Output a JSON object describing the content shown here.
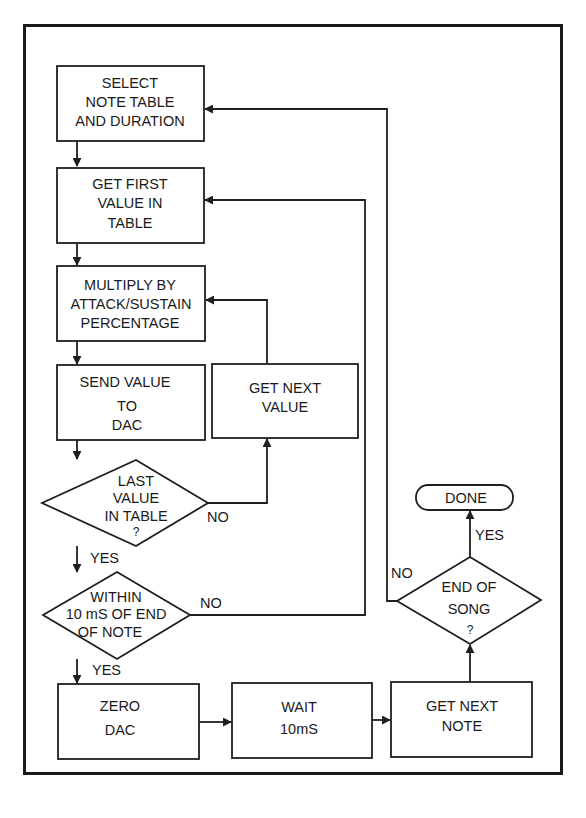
{
  "diagram": {
    "type": "flowchart",
    "nodes": {
      "select_note": {
        "kind": "process",
        "lines": [
          "SELECT",
          "NOTE TABLE",
          "AND DURATION"
        ]
      },
      "get_first": {
        "kind": "process",
        "lines": [
          "GET FIRST",
          "VALUE IN",
          "TABLE"
        ]
      },
      "multiply": {
        "kind": "process",
        "lines": [
          "MULTIPLY BY",
          "ATTACK/SUSTAIN",
          "PERCENTAGE"
        ]
      },
      "send_value": {
        "kind": "process",
        "lines": [
          "SEND VALUE",
          "TO",
          "DAC"
        ]
      },
      "get_next_value": {
        "kind": "process",
        "lines": [
          "GET NEXT",
          "VALUE"
        ]
      },
      "last_value": {
        "kind": "decision",
        "lines": [
          "LAST",
          "VALUE",
          "IN TABLE",
          "?"
        ]
      },
      "within_10ms": {
        "kind": "decision",
        "lines": [
          "WITHIN",
          "10 mS OF END",
          "OF NOTE"
        ]
      },
      "zero_dac": {
        "kind": "process",
        "lines": [
          "ZERO",
          "DAC"
        ]
      },
      "wait": {
        "kind": "process",
        "lines": [
          "WAIT",
          "10mS"
        ]
      },
      "get_next_note": {
        "kind": "process",
        "lines": [
          "GET NEXT",
          "NOTE"
        ]
      },
      "end_of_song": {
        "kind": "decision",
        "lines": [
          "END OF",
          "SONG",
          "?"
        ]
      },
      "done": {
        "kind": "terminal",
        "lines": [
          "DONE"
        ]
      }
    },
    "edge_labels": {
      "last_value_no": "NO",
      "last_value_yes": "YES",
      "within_no": "NO",
      "within_yes": "YES",
      "end_song_yes": "YES",
      "end_song_no": "NO"
    },
    "edges": [
      {
        "from": "select_note",
        "to": "get_first"
      },
      {
        "from": "get_first",
        "to": "multiply"
      },
      {
        "from": "multiply",
        "to": "send_value"
      },
      {
        "from": "send_value",
        "to": "last_value"
      },
      {
        "from": "last_value",
        "to": "get_next_value",
        "label": "NO"
      },
      {
        "from": "get_next_value",
        "to": "multiply"
      },
      {
        "from": "last_value",
        "to": "within_10ms",
        "label": "YES"
      },
      {
        "from": "within_10ms",
        "to": "get_first",
        "label": "NO"
      },
      {
        "from": "within_10ms",
        "to": "zero_dac",
        "label": "YES"
      },
      {
        "from": "zero_dac",
        "to": "wait"
      },
      {
        "from": "wait",
        "to": "get_next_note"
      },
      {
        "from": "get_next_note",
        "to": "end_of_song"
      },
      {
        "from": "end_of_song",
        "to": "done",
        "label": "YES"
      },
      {
        "from": "end_of_song",
        "to": "select_note",
        "label": "NO"
      }
    ]
  }
}
